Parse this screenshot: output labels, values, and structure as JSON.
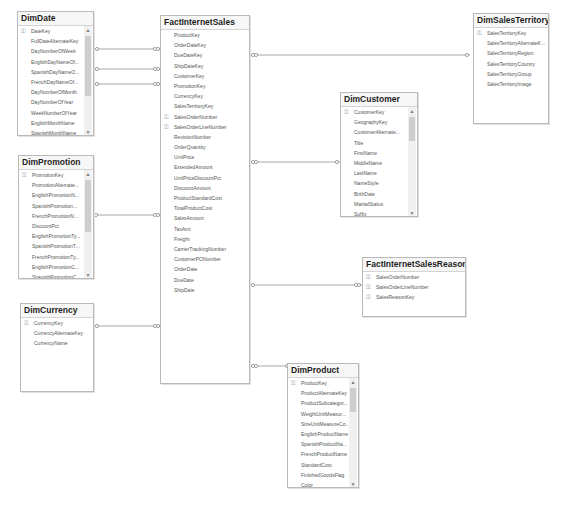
{
  "diagram": {
    "tables": [
      {
        "name": "DimDate",
        "columns": [
          {
            "label": "DateKey",
            "pk": true
          },
          {
            "label": "FullDateAlternateKey"
          },
          {
            "label": "DayNumberOfWeek"
          },
          {
            "label": "EnglishDayNameOf..."
          },
          {
            "label": "SpanishDayNameO..."
          },
          {
            "label": "FrenchDayNameOf..."
          },
          {
            "label": "DayNumberOfMonth"
          },
          {
            "label": "DayNumberOfYear"
          },
          {
            "label": "WeekNumberOfYear"
          },
          {
            "label": "EnglishMonthName"
          },
          {
            "label": "SpanishMonthName"
          }
        ],
        "scrollbar": true
      },
      {
        "name": "FactInternetSales",
        "columns": [
          {
            "label": "ProductKey"
          },
          {
            "label": "OrderDateKey"
          },
          {
            "label": "DueDateKey"
          },
          {
            "label": "ShipDateKey"
          },
          {
            "label": "CustomerKey"
          },
          {
            "label": "PromotionKey"
          },
          {
            "label": "CurrencyKey"
          },
          {
            "label": "SalesTerritoryKey"
          },
          {
            "label": "SalesOrderNumber",
            "pk": true
          },
          {
            "label": "SalesOrderLineNumber",
            "pk": true
          },
          {
            "label": "RevisionNumber"
          },
          {
            "label": "OrderQuantity"
          },
          {
            "label": "UnitPrice"
          },
          {
            "label": "ExtendedAmount"
          },
          {
            "label": "UnitPriceDiscountPct"
          },
          {
            "label": "DiscountAmount"
          },
          {
            "label": "ProductStandardCost"
          },
          {
            "label": "TotalProductCost"
          },
          {
            "label": "SalesAmount"
          },
          {
            "label": "TaxAmt"
          },
          {
            "label": "Freight"
          },
          {
            "label": "CarrierTrackingNumber"
          },
          {
            "label": "CustomerPONumber"
          },
          {
            "label": "OrderDate"
          },
          {
            "label": "DueDate"
          },
          {
            "label": "ShipDate"
          }
        ],
        "scrollbar": false
      },
      {
        "name": "DimSalesTerritory",
        "columns": [
          {
            "label": "SalesTerritoryKey",
            "pk": true
          },
          {
            "label": "SalesTerritoryAlternateK..."
          },
          {
            "label": "SalesTerritoryRegion"
          },
          {
            "label": "SalesTerritoryCountry"
          },
          {
            "label": "SalesTerritoryGroup"
          },
          {
            "label": "SalesTerritoryImage"
          }
        ],
        "scrollbar": false
      },
      {
        "name": "DimCustomer",
        "columns": [
          {
            "label": "CustomerKey",
            "pk": true
          },
          {
            "label": "GeographyKey"
          },
          {
            "label": "CustomerAlternate..."
          },
          {
            "label": "Title"
          },
          {
            "label": "FirstName"
          },
          {
            "label": "MiddleName"
          },
          {
            "label": "LastName"
          },
          {
            "label": "NameStyle"
          },
          {
            "label": "BirthDate"
          },
          {
            "label": "MaritalStatus"
          },
          {
            "label": "Suffix"
          }
        ],
        "scrollbar": true
      },
      {
        "name": "DimPromotion",
        "columns": [
          {
            "label": "PromotionKey",
            "pk": true
          },
          {
            "label": "PromotionAlternate..."
          },
          {
            "label": "EnglishPromotionN..."
          },
          {
            "label": "SpanishPromotion..."
          },
          {
            "label": "FrenchPromotionN..."
          },
          {
            "label": "DiscountPct"
          },
          {
            "label": "EnglishPromotionTy..."
          },
          {
            "label": "SpanishPromotionT..."
          },
          {
            "label": "FrenchPromotionTy..."
          },
          {
            "label": "EnglishPromotionC..."
          },
          {
            "label": "SpanishPromotionC..."
          }
        ],
        "scrollbar": true
      },
      {
        "name": "FactInternetSalesReason",
        "columns": [
          {
            "label": "SalesOrderNumber",
            "pk": true
          },
          {
            "label": "SalesOrderLineNumber",
            "pk": true
          },
          {
            "label": "SalesReasonKey",
            "pk": true
          }
        ],
        "scrollbar": false
      },
      {
        "name": "DimCurrency",
        "columns": [
          {
            "label": "CurrencyKey",
            "pk": true
          },
          {
            "label": "CurrencyAlternateKey"
          },
          {
            "label": "CurrencyName"
          }
        ],
        "scrollbar": false
      },
      {
        "name": "DimProduct",
        "columns": [
          {
            "label": "ProductKey",
            "pk": true
          },
          {
            "label": "ProductAlternateKey"
          },
          {
            "label": "ProductSubcategor..."
          },
          {
            "label": "WeightUnitMeasur..."
          },
          {
            "label": "SizeUnitMeasureCo..."
          },
          {
            "label": "EnglishProductName"
          },
          {
            "label": "SpanishProductNa..."
          },
          {
            "label": "FrenchProductName"
          },
          {
            "label": "StandardCost"
          },
          {
            "label": "FinishedGoodsFlag"
          },
          {
            "label": "Color"
          }
        ],
        "scrollbar": true
      }
    ],
    "relationships": [
      {
        "from": "DimDate",
        "to": "FactInternetSales",
        "label": "OrderDateKey"
      },
      {
        "from": "DimDate",
        "to": "FactInternetSales",
        "label": "DueDateKey"
      },
      {
        "from": "DimDate",
        "to": "FactInternetSales",
        "label": "ShipDateKey"
      },
      {
        "from": "DimSalesTerritory",
        "to": "FactInternetSales",
        "label": "SalesTerritoryKey"
      },
      {
        "from": "DimCustomer",
        "to": "FactInternetSales",
        "label": "CustomerKey"
      },
      {
        "from": "DimPromotion",
        "to": "FactInternetSales",
        "label": "PromotionKey"
      },
      {
        "from": "FactInternetSales",
        "to": "FactInternetSalesReason",
        "label": "SalesOrderNumber"
      },
      {
        "from": "DimCurrency",
        "to": "FactInternetSales",
        "label": "CurrencyKey"
      },
      {
        "from": "DimProduct",
        "to": "FactInternetSales",
        "label": "ProductKey"
      }
    ],
    "colors": {
      "line": "#a8a8a8",
      "border": "#b9b9b9",
      "title": "#1e1e1e",
      "column_text": "#555555",
      "scroll_thumb": "#cdcdcd"
    }
  }
}
